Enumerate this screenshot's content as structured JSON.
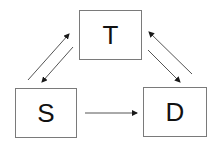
{
  "diagram": {
    "colors": {
      "node_border": "#7a7a7a",
      "edge": "#555555",
      "arrowhead": "#1a1a1a",
      "text": "#111111",
      "background": "#ffffff"
    },
    "nodes": [
      {
        "id": "T",
        "label": "T",
        "position": "top"
      },
      {
        "id": "S",
        "label": "S",
        "position": "bottom-left"
      },
      {
        "id": "D",
        "label": "D",
        "position": "bottom-right"
      }
    ],
    "edges": [
      {
        "from": "S",
        "to": "T"
      },
      {
        "from": "T",
        "to": "S"
      },
      {
        "from": "T",
        "to": "D"
      },
      {
        "from": "D",
        "to": "T"
      },
      {
        "from": "S",
        "to": "D"
      }
    ]
  }
}
